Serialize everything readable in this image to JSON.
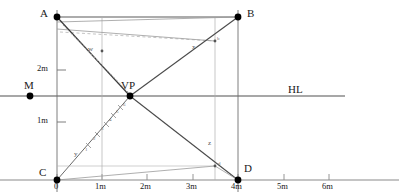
{
  "figure": {
    "colors": {
      "line_dark": "#3a3a3a",
      "line_mid": "#6f6f6f",
      "line_light": "#9a9a9a",
      "line_dashed": "#b8b8b8",
      "point": "#000000",
      "background": "#ffffff"
    }
  },
  "points": [
    {
      "id": "A",
      "label": "A",
      "x": 57,
      "y": 17,
      "dot": true
    },
    {
      "id": "B",
      "label": "B",
      "x": 238,
      "y": 17,
      "dot": true
    },
    {
      "id": "C",
      "label": "C",
      "x": 57,
      "y": 180,
      "dot": true
    },
    {
      "id": "D",
      "label": "D",
      "x": 238,
      "y": 180,
      "dot": true
    },
    {
      "id": "VP",
      "label": "VP",
      "x": 130,
      "y": 96,
      "dot": true
    },
    {
      "id": "M",
      "label": "M",
      "x": 30,
      "y": 96,
      "dot": true
    }
  ],
  "lines_labels": [
    {
      "id": "x",
      "label": "x"
    },
    {
      "id": "y",
      "label": "y"
    },
    {
      "id": "z",
      "label": "z"
    },
    {
      "id": "w",
      "label": "w"
    },
    {
      "id": "b",
      "label": "b"
    },
    {
      "id": "d",
      "label": "d"
    }
  ],
  "horizon": {
    "label": "HL",
    "label_x": 288,
    "label_y": 86,
    "y": 96,
    "x1": 0,
    "x2": 345
  },
  "vertical_scale": {
    "ticks": [
      {
        "label": "2m",
        "y": 70
      },
      {
        "label": "1m",
        "y": 122
      }
    ]
  },
  "ground_axis": {
    "y": 180,
    "x1": 0,
    "x2": 399,
    "ticks": [
      {
        "label": "0",
        "x": 57
      },
      {
        "label": "1m",
        "x": 102
      },
      {
        "label": "2m",
        "x": 147
      },
      {
        "label": "3m",
        "x": 193
      },
      {
        "label": "4m",
        "x": 238
      },
      {
        "label": "5m",
        "x": 284
      },
      {
        "label": "6m",
        "x": 329
      }
    ]
  },
  "diagonal_ticks": {
    "description": "measuring marks along the C to VP diagonal",
    "labels": [
      "1",
      "2",
      "3",
      "4",
      "5",
      "6"
    ]
  }
}
